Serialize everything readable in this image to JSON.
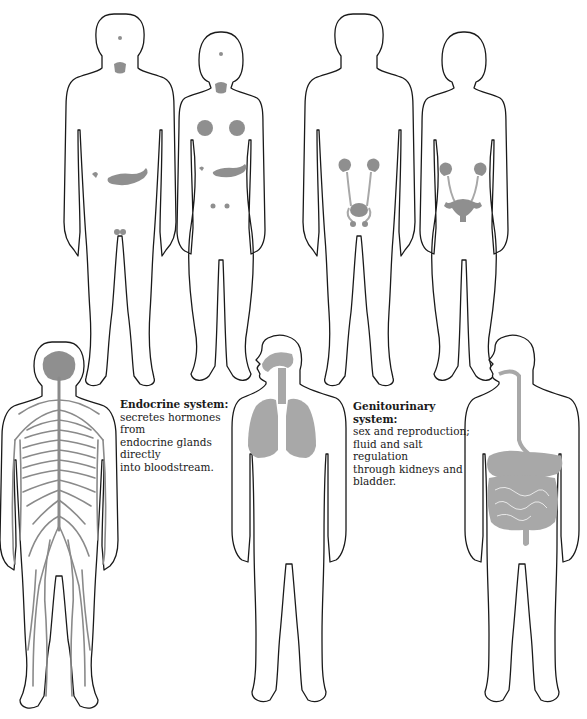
{
  "captions": {
    "endocrine": {
      "title": "Endocrine system:",
      "lines": [
        "secretes hormones from",
        "endocrine glands directly",
        "into bloodstream."
      ]
    },
    "genitourinary": {
      "title": "Genitourinary system:",
      "lines": [
        "sex and reproduction;",
        "fluid and salt regulation",
        "through kidneys and",
        "bladder."
      ]
    }
  },
  "figures": [
    {
      "id": "endocrine-male",
      "system": "endocrine",
      "view": "front",
      "sex": "male",
      "highlighted": [
        "pituitary",
        "thyroid",
        "adrenals",
        "pancreas",
        "testes"
      ]
    },
    {
      "id": "endocrine-female",
      "system": "endocrine",
      "view": "front",
      "sex": "female",
      "highlighted": [
        "pituitary",
        "thyroid",
        "breasts",
        "adrenals",
        "pancreas",
        "ovaries"
      ]
    },
    {
      "id": "genitourinary-male",
      "system": "genitourinary",
      "view": "front",
      "sex": "male",
      "highlighted": [
        "kidneys",
        "ureters",
        "bladder",
        "prostate"
      ]
    },
    {
      "id": "genitourinary-female",
      "system": "genitourinary",
      "view": "front",
      "sex": "female",
      "highlighted": [
        "kidneys",
        "ureters",
        "bladder",
        "uterus",
        "ovaries"
      ]
    },
    {
      "id": "nervous",
      "system": "nervous",
      "view": "back",
      "highlighted": [
        "brain",
        "spinal cord",
        "peripheral nerves"
      ]
    },
    {
      "id": "respiratory",
      "system": "respiratory",
      "view": "front-profile",
      "highlighted": [
        "nasal passage",
        "trachea",
        "lungs"
      ]
    },
    {
      "id": "digestive",
      "system": "digestive",
      "view": "front-profile",
      "highlighted": [
        "esophagus",
        "stomach",
        "liver",
        "intestines"
      ]
    }
  ],
  "colors": {
    "outline": "#1a1a1a",
    "organ": "#8f8f8f",
    "background": "#ffffff"
  }
}
